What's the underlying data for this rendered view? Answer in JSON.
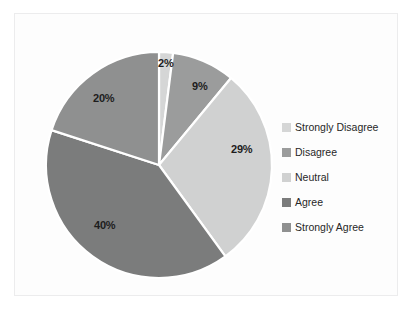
{
  "chart_data": {
    "type": "pie",
    "title": "",
    "categories": [
      "Strongly Disagree",
      "Disagree",
      "Neutral",
      "Agree",
      "Strongly Agree"
    ],
    "values": [
      2,
      9,
      29,
      40,
      20
    ],
    "value_labels": [
      "2%",
      "9%",
      "29%",
      "40%",
      "20%"
    ],
    "colors": [
      "#d5d6d6",
      "#9b9c9c",
      "#d0d1d1",
      "#7b7c7c",
      "#8f9090"
    ],
    "start_angle_deg": 0,
    "direction": "clockwise",
    "legend_position": "right",
    "grid": false,
    "units": "percent",
    "slice_label_format": "percent"
  },
  "plot": {
    "background": "#fdfdfd",
    "border_color": "#ececed",
    "label_text_color": "#1d1d1d",
    "slice_separator_color": "#ffffff"
  },
  "legend": {
    "items": [
      {
        "label": "Strongly Disagree",
        "color": "#d5d6d6"
      },
      {
        "label": "Disagree",
        "color": "#9b9c9c"
      },
      {
        "label": "Neutral",
        "color": "#d0d1d1"
      },
      {
        "label": "Agree",
        "color": "#7b7c7c"
      },
      {
        "label": "Strongly Agree",
        "color": "#8f9090"
      }
    ],
    "text_color": "#272727"
  },
  "labels": {
    "slice_0": "2%",
    "slice_1": "9%",
    "slice_2": "29%",
    "slice_3": "40%",
    "slice_4": "20%"
  }
}
